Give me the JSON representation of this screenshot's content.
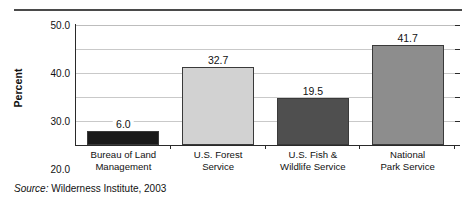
{
  "figure": {
    "top_rule": true,
    "source": {
      "label": "Source:",
      "text": "Wilderness Institute, 2003"
    }
  },
  "chart_data": {
    "type": "bar",
    "title": "",
    "xlabel": "",
    "ylabel": "Percent",
    "categories": [
      "Bureau of Land Management",
      "U.S. Forest Service",
      "U.S. Fish & Wildlife Service",
      "National Park Service"
    ],
    "category_lines": [
      [
        "Bureau of Land",
        "Management"
      ],
      [
        "U.S. Forest",
        "Service"
      ],
      [
        "U.S. Fish &",
        "Wildlife Service"
      ],
      [
        "National",
        "Park Service"
      ]
    ],
    "values": [
      6.0,
      32.7,
      19.5,
      41.7
    ],
    "value_labels": [
      "6.0",
      "32.7",
      "19.5",
      "41.7"
    ],
    "bar_colors": [
      "#1a1a1a",
      "#d2d2d2",
      "#4f4f4f",
      "#8d8d8d"
    ],
    "bar_border_color": "#3a3a3a",
    "ylim": [
      0.0,
      50.0
    ],
    "ytick_values": [
      0.0,
      10.0,
      20.0,
      30.0,
      40.0,
      50.0
    ],
    "ytick_labels": [
      "0.0",
      "10.0",
      "20.0",
      "30.0",
      "40.0",
      "50.0"
    ],
    "grid": true,
    "grid_color": "#c9c9c9",
    "legend": null,
    "axis_color": "#2a2a2a",
    "background": "#ffffff"
  }
}
